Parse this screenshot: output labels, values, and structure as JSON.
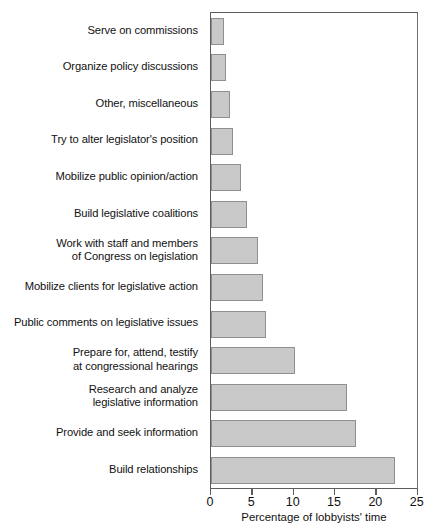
{
  "chart_data": {
    "type": "bar",
    "orientation": "horizontal",
    "title": "",
    "xlabel": "Percentage of lobbyists' time",
    "ylabel": "",
    "xlim": [
      0,
      25
    ],
    "xticks": [
      0,
      5,
      10,
      15,
      20,
      25
    ],
    "grid": false,
    "legend": null,
    "bar_color": "#c9c9c9",
    "bar_edge_color": "#8f8f8f",
    "categories": [
      "Serve on commissions",
      "Organize policy discussions",
      "Other, miscellaneous",
      "Try to alter legislator's position",
      "Mobilize public opinion/action",
      "Build legislative coalitions",
      "Work with staff and members of Congress on legislation",
      "Mobilize clients for legislative action",
      "Public comments on legislative issues",
      "Prepare for, attend, testify at congressional hearings",
      "Research and analyze legislative information",
      "Provide and seek information",
      "Build relationships"
    ],
    "category_lines": [
      [
        "Serve on commissions"
      ],
      [
        "Organize policy discussions"
      ],
      [
        "Other, miscellaneous"
      ],
      [
        "Try to alter legislator's position"
      ],
      [
        "Mobilize public opinion/action"
      ],
      [
        "Build legislative coalitions"
      ],
      [
        "Work with staff and members",
        "of Congress on legislation"
      ],
      [
        "Mobilize clients for legislative action"
      ],
      [
        "Public comments on legislative issues"
      ],
      [
        "Prepare for, attend, testify",
        "at congressional hearings"
      ],
      [
        "Research and analyze",
        "legislative information"
      ],
      [
        "Provide and seek information"
      ],
      [
        "Build relationships"
      ]
    ],
    "values": [
      1.6,
      1.8,
      2.3,
      2.7,
      3.6,
      4.4,
      5.7,
      6.3,
      6.6,
      10.2,
      16.4,
      17.5,
      22.2
    ]
  }
}
